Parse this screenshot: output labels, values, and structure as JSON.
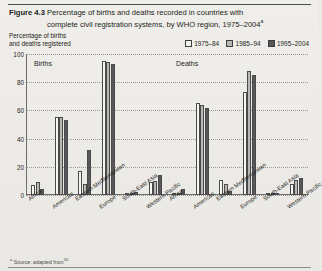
{
  "figure": {
    "label": "Figure 4.3",
    "title_line1": "Percentage of births and deaths recorded in countries with",
    "title_line2": "complete civil registration systems, by WHO region, 1975–2004",
    "title_superscript": "a",
    "axis_title_line1": "Percentage of births",
    "axis_title_line2": "and deaths registered",
    "footnote": "Source: adapted from",
    "footnote_sup_left": "a",
    "footnote_sup_right": "50"
  },
  "legend": {
    "items": [
      {
        "label": "1975–84",
        "color": "#f4f3f0"
      },
      {
        "label": "1985–94",
        "color": "#b9b8b4"
      },
      {
        "label": "1995–2004",
        "color": "#58585a"
      }
    ]
  },
  "panels": {
    "births_label": "Births",
    "deaths_label": "Deaths"
  },
  "chart_data": {
    "type": "bar",
    "title": "Percentage of births and deaths recorded in countries with complete civil registration systems, by WHO region, 1975–2004",
    "xlabel": "",
    "ylabel": "Percentage of births and deaths registered",
    "ylim": [
      0,
      100
    ],
    "yticks": [
      0,
      20,
      40,
      60,
      80,
      100
    ],
    "grid": true,
    "legend_position": "top-right",
    "categories": [
      "Africa",
      "Americas",
      "Eastern Mediterranean",
      "Europe",
      "South-East Asia",
      "Western Pacific"
    ],
    "panels": [
      {
        "name": "Births",
        "series": [
          {
            "name": "1975–84",
            "values": [
              7,
              55,
              17,
              95,
              1,
              9
            ]
          },
          {
            "name": "1985–94",
            "values": [
              9,
              55,
              8,
              94,
              1,
              10
            ]
          },
          {
            "name": "1995–2004",
            "values": [
              4,
              53,
              32,
              93,
              2,
              14
            ]
          }
        ]
      },
      {
        "name": "Deaths",
        "series": [
          {
            "name": "1975–84",
            "values": [
              1,
              65,
              11,
              73,
              1,
              8
            ]
          },
          {
            "name": "1985–94",
            "values": [
              1,
              64,
              8,
              88,
              1,
              11
            ]
          },
          {
            "name": "1995–2004",
            "values": [
              4,
              62,
              3,
              85,
              1,
              12
            ]
          }
        ]
      }
    ]
  }
}
